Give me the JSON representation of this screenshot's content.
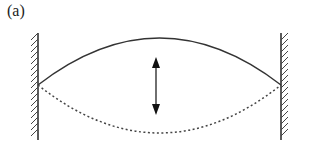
{
  "figure": {
    "panel_label": "(a)",
    "elements": {
      "left_wall": "hatched fixed wall",
      "right_wall": "hatched fixed wall",
      "upper_displacement": "solid arc",
      "lower_displacement": "dotted arc",
      "oscillation_arrow": "double-headed vertical arrow"
    },
    "colors": {
      "line": "#333333"
    }
  }
}
